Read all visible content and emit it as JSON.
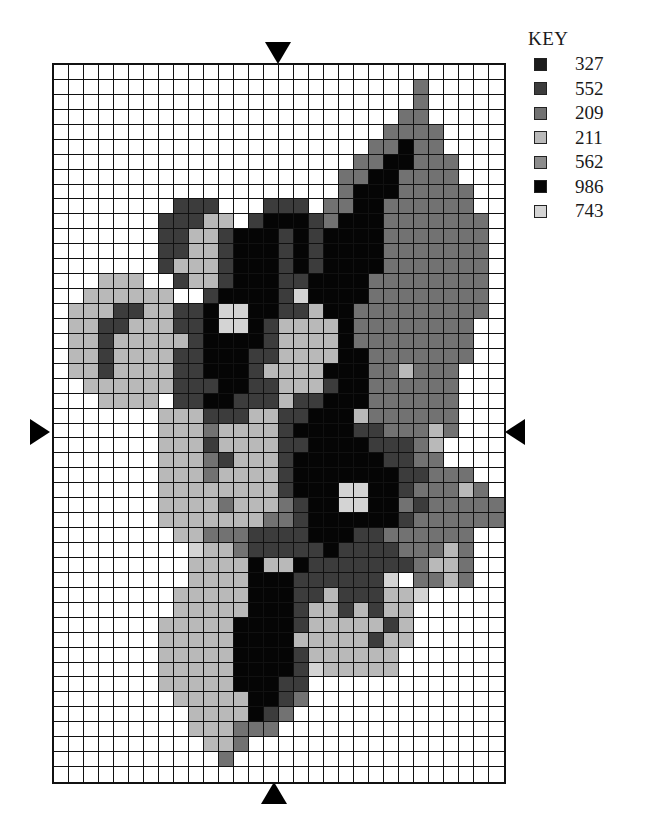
{
  "header": {
    "cut_off_caption": "…ng … p…"
  },
  "key": {
    "title": "KEY",
    "items": [
      {
        "code": "A",
        "label": "327",
        "color": "#1c1c1c"
      },
      {
        "code": "B",
        "label": "552",
        "color": "#3c3c3c"
      },
      {
        "code": "C",
        "label": "209",
        "color": "#727272"
      },
      {
        "code": "D",
        "label": "211",
        "color": "#b9b9b9"
      },
      {
        "code": "E",
        "label": "562",
        "color": "#8c8c8c"
      },
      {
        "code": "F",
        "label": "986",
        "color": "#050505"
      },
      {
        "code": "G",
        "label": "743",
        "color": "#d4d4d4"
      }
    ]
  },
  "grid": {
    "columns": 30,
    "rows": 48,
    "cell_width": 15.03,
    "cell_height": 14.94,
    "empty_color": "#ffffff",
    "cells": [
      "..............................",
      "........................C.....",
      "........................C.....",
      ".......................CC.....",
      "......................CCCC....",
      ".....................CCFCC....",
      "....................CCFFCCC...",
      "...................CCFFCCCC...",
      "...................CFFFCCCCC..",
      "........BBB...BBB.CCFFCCCCCC..",
      ".......BBBDD.BFFFBCFFFCCCCCCC.",
      ".......BBDDBFFFBFBFFFFCCCCCCC.",
      ".......BBDDBFFFBFBFFFFCCCCCCC.",
      ".......BDDDBFFFBFBFFFFCCCCCCC.",
      "...DDD..BDDBFFFBBFFFFCCCCCCCC.",
      "..DDDDDD..BFFFFBGFFFFCCCCCCCC.",
      ".DDDBBDDBBFGGFFBBDFFCCCCCCCCC.",
      ".DDBBDDDBBFGGFBDDDDFCCCCCCCC..",
      ".DDBDDDDDBFFFFBDDDDFCCCCCCCC..",
      ".DDBDDDDBBFFFBBDDDDFFCCCCCCC..",
      ".DDBDDDDBBFFFBDDDDFFFCCDCCC...",
      "..DDDDDDBBBFFBBDDDBFFCCCCCC...",
      "...DDDD.BBFFBBBDBBFFFCCCCCC...",
      ".......DDDBBBDDBBFFFDCCCCCC...",
      ".......DDDCDDDDBFFFFBBCCCDC...",
      ".......DDDBDDDDBBFFFFBBBCD....",
      ".......DDDCBDDDBFFFFFFBBCC....",
      ".......DDDCDDDDBFFFFFFFBBCCC..",
      ".......DDDDDDDDBFFFGGFFBCCCDC.",
      ".......DDDDCDDDCBFFGGFFCBCCCCC",
      ".......DDDDDDDCCBFFFFFFBCCCCCC",
      "........DDCCCBBBBFFFBBCCCCCC..",
      ".........GDDCBBBBBFBBBBCCCDC..",
      ".........DDDDFDDFBBBBBBBCDDC..",
      ".........DDDDFFFBBBBBBG.CCDC..",
      "........DDDDDFFFBBDBBBDDG.....",
      "........DDDDDFFFBDDBDBDD......",
      ".......DDDDDFFFFBDDDDDBD......",
      ".......DDDDDFFFFDDDDDBDD......",
      ".......DDDDDFFFFBDDDDDD.......",
      ".......DDDDDFFFFBGDDDDD.......",
      ".......DDDDDFFFBB.............",
      "........DDDDDFFBC.............",
      ".........DDDDFBC..............",
      ".........DDDCCC...............",
      "..........DDC.................",
      "...........C..................",
      "........................... .."
    ]
  },
  "markers": {
    "top": {
      "x": 278,
      "y": 42
    },
    "bottom": {
      "x": 274,
      "y": 782
    },
    "left": {
      "x": 30,
      "y": 419
    },
    "right": {
      "x": 504,
      "y": 419
    }
  }
}
